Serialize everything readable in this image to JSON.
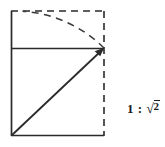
{
  "figure": {
    "stroke_color": "#2a2a2a",
    "background_color": "#ffffff",
    "square": {
      "label": "unit-square",
      "left": 11,
      "top": 48,
      "right": 104,
      "bottom": 136,
      "style": "solid"
    },
    "extension_rectangle": {
      "label": "root-two-rectangle",
      "left": 11,
      "top": 11,
      "right": 104,
      "bottom": 136,
      "style": "dashed"
    },
    "diagonal": {
      "label": "square-diagonal-arrow",
      "x1": 11,
      "y1": 136,
      "x2": 104,
      "y2": 48,
      "style": "solid",
      "arrowhead": "end"
    },
    "arc": {
      "label": "radius-sweep-arc",
      "center_x": 11,
      "center_y": 136,
      "from_x": 104,
      "from_y": 48,
      "to_x": 22,
      "to_y": 11,
      "style": "dashed"
    },
    "mid_line": {
      "label": "square-top-edge",
      "x1": 11,
      "y1": 48,
      "x2": 104,
      "y2": 48,
      "style": "solid"
    }
  },
  "annotation": {
    "ratio_prefix": "1",
    "ratio_separator": ":",
    "radical_sign": "√",
    "radicand": "2",
    "full_text": "1 : √2"
  }
}
